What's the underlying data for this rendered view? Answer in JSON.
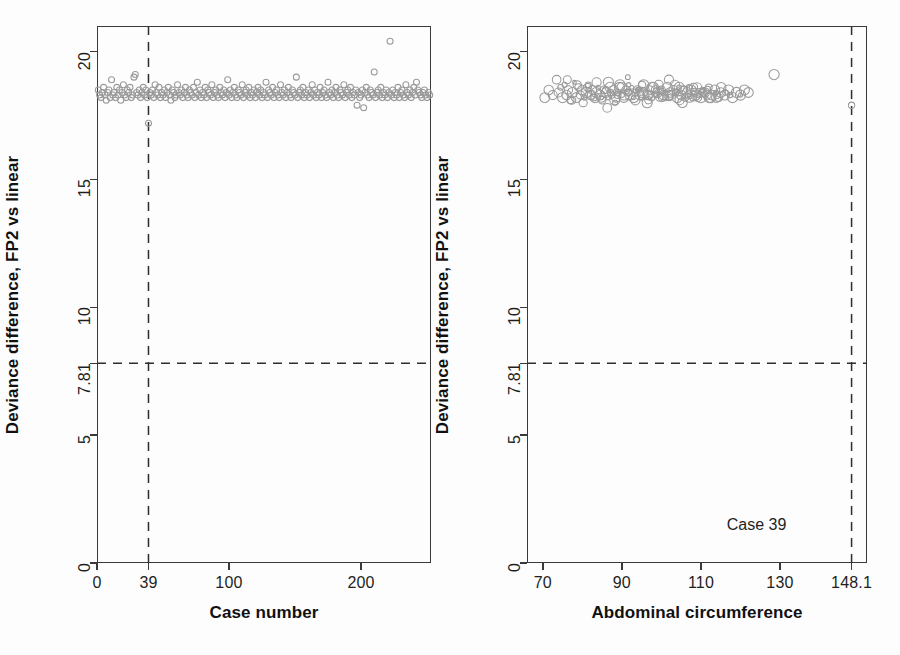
{
  "figure": {
    "background_color": "#fdfdfd",
    "marker_color": "#9a9a9a",
    "axis_color": "#3a3a3a",
    "refline_color": "#2e2e2e"
  },
  "chart_data": [
    {
      "type": "scatter",
      "panel": "left",
      "title": "",
      "xlabel": "Case number",
      "ylabel": "Deviance difference, FP2 vs linear",
      "xlim": [
        0,
        253
      ],
      "ylim": [
        0,
        21
      ],
      "xticks": [
        0,
        39,
        100,
        200
      ],
      "xticklabels": [
        "0",
        "39",
        "100",
        "200"
      ],
      "yticks": [
        0,
        5,
        7.81,
        10,
        15,
        20
      ],
      "yticklabels": [
        "0",
        "5",
        "7.81",
        "10",
        "15",
        "20"
      ],
      "grid": false,
      "legend": "none",
      "reference_lines": [
        {
          "orientation": "horizontal",
          "value": 7.81,
          "style": "dashed",
          "label": "7.81"
        },
        {
          "orientation": "vertical",
          "value": 39,
          "style": "dashed",
          "label": "39"
        }
      ],
      "annotations": [],
      "series": [
        {
          "name": "Deviance difference",
          "marker": "open-circle",
          "x": [
            1,
            2,
            3,
            4,
            5,
            6,
            7,
            8,
            9,
            10,
            11,
            12,
            13,
            14,
            15,
            16,
            17,
            18,
            19,
            20,
            21,
            22,
            23,
            24,
            25,
            26,
            27,
            28,
            29,
            30,
            31,
            32,
            33,
            34,
            35,
            36,
            37,
            38,
            39,
            40,
            41,
            42,
            43,
            44,
            45,
            46,
            47,
            48,
            49,
            50,
            51,
            52,
            53,
            54,
            55,
            56,
            57,
            58,
            59,
            60,
            61,
            62,
            63,
            64,
            65,
            66,
            67,
            68,
            69,
            70,
            71,
            72,
            73,
            74,
            75,
            76,
            77,
            78,
            79,
            80,
            81,
            82,
            83,
            84,
            85,
            86,
            87,
            88,
            89,
            90,
            91,
            92,
            93,
            94,
            95,
            96,
            97,
            98,
            99,
            100,
            101,
            102,
            103,
            104,
            105,
            106,
            107,
            108,
            109,
            110,
            111,
            112,
            113,
            114,
            115,
            116,
            117,
            118,
            119,
            120,
            121,
            122,
            123,
            124,
            125,
            126,
            127,
            128,
            129,
            130,
            131,
            132,
            133,
            134,
            135,
            136,
            137,
            138,
            139,
            140,
            141,
            142,
            143,
            144,
            145,
            146,
            147,
            148,
            149,
            150,
            151,
            152,
            153,
            154,
            155,
            156,
            157,
            158,
            159,
            160,
            161,
            162,
            163,
            164,
            165,
            166,
            167,
            168,
            169,
            170,
            171,
            172,
            173,
            174,
            175,
            176,
            177,
            178,
            179,
            180,
            181,
            182,
            183,
            184,
            185,
            186,
            187,
            188,
            189,
            190,
            191,
            192,
            193,
            194,
            195,
            196,
            197,
            198,
            199,
            200,
            201,
            202,
            203,
            204,
            205,
            206,
            207,
            208,
            209,
            210,
            211,
            212,
            213,
            214,
            215,
            216,
            217,
            218,
            219,
            220,
            221,
            222,
            223,
            224,
            225,
            226,
            227,
            228,
            229,
            230,
            231,
            232,
            233,
            234,
            235,
            236,
            237,
            238,
            239,
            240,
            241,
            242,
            243,
            244,
            245,
            246,
            247,
            248,
            249,
            250,
            251,
            252
          ],
          "y": [
            18.5,
            18.3,
            18.2,
            18.4,
            18.6,
            18.3,
            18.1,
            18.4,
            18.5,
            18.2,
            18.9,
            18.3,
            18.4,
            18.2,
            18.6,
            18.3,
            18.5,
            18.1,
            18.4,
            18.7,
            18.3,
            18.2,
            18.5,
            18.4,
            18.6,
            18.2,
            18.3,
            19.0,
            19.1,
            18.4,
            18.3,
            18.5,
            18.2,
            18.4,
            18.6,
            18.3,
            18.5,
            18.2,
            17.2,
            18.4,
            18.3,
            18.5,
            18.2,
            18.7,
            18.4,
            18.3,
            18.6,
            18.2,
            18.4,
            18.3,
            18.5,
            18.2,
            18.4,
            18.6,
            18.3,
            18.1,
            18.5,
            18.4,
            18.2,
            18.3,
            18.7,
            18.4,
            18.3,
            18.5,
            18.2,
            18.4,
            18.6,
            18.3,
            18.2,
            18.5,
            18.4,
            18.3,
            18.6,
            18.2,
            18.4,
            18.8,
            18.3,
            18.5,
            18.2,
            18.4,
            18.3,
            18.6,
            18.2,
            18.5,
            18.4,
            18.3,
            18.7,
            18.2,
            18.4,
            18.5,
            18.3,
            18.2,
            18.6,
            18.4,
            18.3,
            18.5,
            18.2,
            18.4,
            18.9,
            18.3,
            18.5,
            18.2,
            18.4,
            18.6,
            18.3,
            18.2,
            18.5,
            18.4,
            18.3,
            18.7,
            18.2,
            18.4,
            18.5,
            18.3,
            18.6,
            18.2,
            18.4,
            18.3,
            18.5,
            18.2,
            18.4,
            18.6,
            18.3,
            18.5,
            18.2,
            18.4,
            18.3,
            18.8,
            18.2,
            18.5,
            18.4,
            18.3,
            18.6,
            18.2,
            18.4,
            18.5,
            18.3,
            18.2,
            18.7,
            18.4,
            18.3,
            18.5,
            18.2,
            18.4,
            18.6,
            18.3,
            18.2,
            18.5,
            18.4,
            18.3,
            19.0,
            18.2,
            18.4,
            18.5,
            18.3,
            18.6,
            18.2,
            18.4,
            18.3,
            18.5,
            18.2,
            18.4,
            18.7,
            18.3,
            18.5,
            18.2,
            18.4,
            18.3,
            18.6,
            18.2,
            18.4,
            18.5,
            18.3,
            18.2,
            18.8,
            18.4,
            18.3,
            18.5,
            18.2,
            18.4,
            18.6,
            18.3,
            18.2,
            18.5,
            18.4,
            18.3,
            18.7,
            18.2,
            18.4,
            18.5,
            18.3,
            18.6,
            18.2,
            18.4,
            18.3,
            18.5,
            17.9,
            18.4,
            18.2,
            18.3,
            18.5,
            17.8,
            18.4,
            18.6,
            18.3,
            18.2,
            18.5,
            18.4,
            18.3,
            19.2,
            18.2,
            18.4,
            18.5,
            18.3,
            18.6,
            18.2,
            18.4,
            18.3,
            18.5,
            18.2,
            18.4,
            20.4,
            18.3,
            18.5,
            18.2,
            18.4,
            18.3,
            18.6,
            18.2,
            18.4,
            18.5,
            18.3,
            18.2,
            18.7,
            18.4,
            18.3,
            18.5,
            18.2,
            18.4,
            18.6,
            18.3,
            18.8,
            18.5,
            18.4,
            18.3,
            18.2,
            18.4,
            18.5,
            18.3,
            18.2,
            18.4,
            18.3,
            18.5,
            18.2,
            18.3
          ]
        }
      ]
    },
    {
      "type": "scatter",
      "panel": "right",
      "title": "",
      "xlabel": "Abdominal circumference",
      "ylabel": "Deviance difference, FP2 vs linear",
      "xlim": [
        66,
        152
      ],
      "ylim": [
        0,
        21
      ],
      "xticks": [
        70,
        90,
        110,
        130,
        148.1
      ],
      "xticklabels": [
        "70",
        "90",
        "110",
        "130",
        "148.1"
      ],
      "yticks": [
        0,
        5,
        7.81,
        10,
        15,
        20
      ],
      "yticklabels": [
        "0",
        "5",
        "7.81",
        "10",
        "15",
        "20"
      ],
      "grid": false,
      "legend": "none",
      "reference_lines": [
        {
          "orientation": "horizontal",
          "value": 7.81,
          "style": "dashed",
          "label": "7.81"
        },
        {
          "orientation": "vertical",
          "value": 148.1,
          "style": "dashed",
          "label": "148.1"
        }
      ],
      "annotations": [
        {
          "text": "Case 39",
          "x": 135.5,
          "y": 1.45
        }
      ],
      "series": [
        {
          "name": "Deviance difference",
          "marker": "open-circle-varsize",
          "x": [
            70.5,
            71.5,
            72.5,
            73.5,
            74.0,
            74.5,
            75.0,
            75.5,
            76.0,
            76.5,
            77.0,
            77.5,
            78.0,
            78.5,
            79.0,
            79.5,
            80.0,
            80.5,
            81.0,
            81.5,
            82.0,
            82.5,
            83.0,
            83.5,
            84.0,
            84.5,
            85.0,
            85.5,
            86.0,
            86.5,
            87.0,
            87.5,
            88.0,
            88.5,
            89.0,
            89.5,
            90.0,
            90.5,
            91.0,
            91.5,
            92.0,
            92.5,
            93.0,
            93.5,
            94.0,
            94.5,
            95.0,
            95.5,
            96.0,
            96.5,
            97.0,
            97.5,
            98.0,
            98.5,
            99.0,
            99.5,
            100.0,
            100.5,
            101.0,
            101.5,
            102.0,
            102.5,
            103.0,
            103.5,
            104.0,
            104.5,
            105.0,
            105.5,
            106.0,
            106.5,
            107.0,
            107.5,
            108.0,
            108.5,
            109.0,
            109.5,
            110.0,
            110.5,
            111.0,
            111.5,
            112.0,
            112.5,
            113.0,
            113.5,
            114.0,
            114.5,
            115.0,
            116.0,
            117.0,
            118.0,
            119.0,
            120.0,
            121.0,
            122.0,
            76.2,
            77.3,
            78.7,
            80.2,
            81.3,
            82.4,
            83.6,
            84.8,
            85.9,
            87.1,
            88.2,
            89.4,
            90.6,
            91.7,
            92.9,
            94.1,
            95.2,
            96.4,
            97.6,
            98.7,
            99.9,
            101.1,
            102.2,
            103.4,
            104.6,
            105.7,
            106.9,
            108.1,
            109.2,
            110.4,
            111.6,
            112.7,
            113.9,
            115.1,
            116.2,
            117.4,
            81.5,
            83.2,
            84.9,
            86.6,
            88.3,
            90.0,
            91.7,
            93.4,
            95.1,
            96.8,
            98.5,
            100.2,
            101.9,
            103.6,
            105.3,
            107.0,
            108.7,
            110.4,
            112.1,
            113.8,
            86.3,
            88.9,
            91.5,
            94.1,
            96.7,
            99.3,
            101.9,
            104.5,
            107.1,
            109.7,
            128.5,
            120.0,
            148.1
          ],
          "y": [
            18.2,
            18.5,
            18.3,
            18.9,
            18.4,
            18.6,
            18.2,
            18.7,
            18.3,
            18.5,
            18.1,
            18.4,
            18.8,
            18.2,
            18.6,
            18.3,
            18.5,
            18.2,
            18.4,
            18.7,
            18.3,
            18.5,
            18.2,
            18.4,
            18.6,
            18.3,
            18.1,
            18.5,
            18.4,
            18.2,
            18.6,
            18.3,
            18.5,
            18.2,
            18.4,
            18.7,
            18.3,
            18.2,
            18.5,
            18.4,
            18.3,
            18.6,
            18.2,
            18.4,
            18.5,
            18.3,
            18.2,
            18.7,
            18.4,
            18.3,
            18.5,
            18.2,
            18.6,
            18.3,
            18.4,
            18.2,
            18.5,
            18.3,
            18.4,
            18.6,
            18.2,
            18.3,
            18.5,
            18.4,
            18.2,
            18.6,
            18.3,
            18.5,
            18.2,
            18.4,
            18.3,
            18.5,
            18.2,
            18.4,
            18.6,
            18.3,
            18.2,
            18.5,
            18.4,
            18.3,
            18.6,
            18.2,
            18.4,
            18.5,
            18.3,
            18.2,
            18.4,
            18.3,
            18.5,
            18.2,
            18.4,
            18.3,
            18.5,
            18.4,
            18.9,
            18.1,
            18.7,
            18.0,
            18.6,
            18.3,
            18.8,
            18.2,
            18.5,
            18.4,
            18.1,
            18.6,
            18.3,
            18.7,
            18.2,
            18.5,
            18.4,
            18.0,
            18.6,
            18.3,
            18.5,
            18.2,
            18.4,
            18.7,
            18.1,
            18.5,
            18.3,
            18.6,
            18.2,
            18.4,
            18.5,
            18.3,
            18.2,
            18.6,
            18.4,
            18.3,
            18.5,
            18.2,
            18.2,
            18.8,
            18.0,
            18.6,
            18.4,
            18.1,
            18.7,
            18.3,
            18.5,
            18.2,
            18.9,
            18.4,
            18.0,
            18.6,
            18.3,
            18.5,
            18.2,
            18.4,
            17.8,
            18.3,
            19.0,
            18.5,
            18.1,
            18.7,
            18.3,
            18.6,
            18.2,
            18.4,
            19.1,
            18.3,
            17.9,
            18.5,
            17.4,
            20.4,
            1.45
          ]
        }
      ]
    }
  ],
  "panels": {
    "left": {
      "xaxis_title": "Case number",
      "yaxis_title": "Deviance difference, FP2 vs linear",
      "xticklabels": [
        "0",
        "39",
        "100",
        "200"
      ],
      "yticklabels": [
        "0",
        "5",
        "7.81",
        "10",
        "15",
        "20"
      ]
    },
    "right": {
      "xaxis_title": "Abdominal circumference",
      "yaxis_title": "Deviance difference, FP2 vs linear",
      "xticklabels": [
        "70",
        "90",
        "110",
        "130",
        "148.1"
      ],
      "yticklabels": [
        "0",
        "5",
        "7.81",
        "10",
        "15",
        "20"
      ],
      "case_annotation": "Case 39"
    }
  }
}
